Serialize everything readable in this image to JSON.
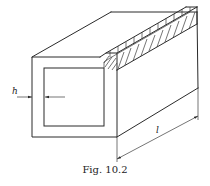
{
  "figure": {
    "caption": "Fig. 10.2",
    "labels": {
      "wall_thickness": "h",
      "length": "l"
    }
  },
  "colors": {
    "line": "#2a2a2a",
    "background": "#ffffff"
  }
}
